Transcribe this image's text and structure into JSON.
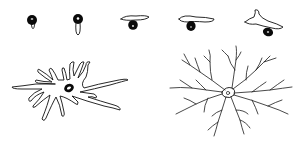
{
  "figure": {
    "colors": {
      "background": "#ffffff",
      "ink": "#111111"
    },
    "top_row": {
      "stages": [
        {
          "id": "stage-1",
          "shape": "round cell with small process"
        },
        {
          "id": "stage-2",
          "shape": "round cell with elongated tail"
        },
        {
          "id": "stage-3",
          "shape": "cell with thin horizontal bar"
        },
        {
          "id": "stage-4",
          "shape": "cell with wider bar"
        },
        {
          "id": "stage-5",
          "shape": "cell with branched bar"
        }
      ]
    },
    "bottom_row": {
      "cells": [
        {
          "id": "cell-thick-processes",
          "shape": "cell with thick branching processes"
        },
        {
          "id": "cell-fine-processes",
          "shape": "highly ramified cell with fine branches"
        }
      ]
    }
  }
}
